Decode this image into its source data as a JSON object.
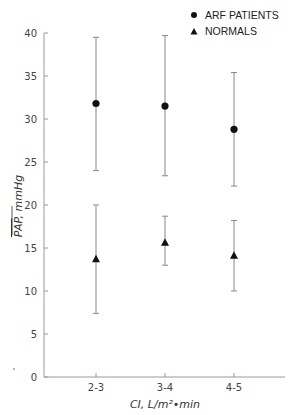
{
  "chart_data": {
    "type": "scatter",
    "title": "",
    "xlabel": "CI, L/m²•min",
    "ylabel": "PAP, mmHg",
    "ylabel_overline": "PAP",
    "ylabel_rest": ", mmHg",
    "ylim": [
      0,
      40
    ],
    "yticks": [
      0,
      5,
      10,
      15,
      20,
      25,
      30,
      35,
      40
    ],
    "categories": [
      "2-3",
      "3-4",
      "4-5"
    ],
    "grid": false,
    "legend_position": "top-right",
    "series": [
      {
        "name": "ARF PATIENTS",
        "marker": "circle",
        "values": [
          31.8,
          31.5,
          28.8
        ],
        "error_low": [
          24.0,
          23.4,
          22.2
        ],
        "error_high": [
          39.5,
          39.7,
          35.4
        ]
      },
      {
        "name": "NORMALS",
        "marker": "triangle",
        "values": [
          13.7,
          15.6,
          14.1
        ],
        "error_low": [
          7.4,
          13.0,
          10.0
        ],
        "error_high": [
          20.0,
          18.7,
          18.2
        ]
      }
    ]
  }
}
